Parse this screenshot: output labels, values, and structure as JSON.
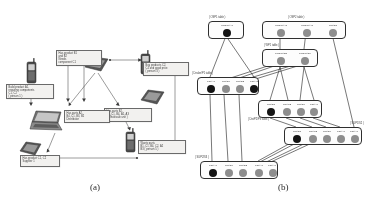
{
  "figure": {
    "caption_a": "(a)",
    "caption_b": "(b)"
  },
  "panel_a": {
    "name": "scenario-diagram",
    "devices": [
      {
        "id": "phone-1",
        "type": "mobile-phone",
        "x": 26,
        "y": 58,
        "w": 11,
        "h": 26
      },
      {
        "id": "pda-1",
        "type": "pda-tablet",
        "x": 83,
        "y": 55,
        "w": 26,
        "h": 18
      },
      {
        "id": "phone-2",
        "type": "mobile-phone",
        "x": 140,
        "y": 50,
        "w": 11,
        "h": 24
      },
      {
        "id": "pda-2",
        "type": "pda-tablet",
        "x": 139,
        "y": 88,
        "w": 26,
        "h": 18
      },
      {
        "id": "laptop-1",
        "type": "laptop",
        "x": 28,
        "y": 108,
        "w": 38,
        "h": 24
      },
      {
        "id": "pda-3",
        "type": "pda-tablet",
        "x": 18,
        "y": 140,
        "w": 24,
        "h": 17
      },
      {
        "id": "phone-3",
        "type": "mobile-phone",
        "x": 125,
        "y": 128,
        "w": 11,
        "h": 24
      }
    ],
    "callouts": [
      {
        "id": "callout-left",
        "x": 6,
        "y": 84,
        "w": 48,
        "h": 15,
        "text": "Build product A1,\nrequiring components\nC1, C2\n( person 1 )"
      },
      {
        "id": "callout-top",
        "x": 56,
        "y": 50,
        "w": 46,
        "h": 16,
        "text": "Has product B1\nand B2\nNeeds\ncomponent C1"
      },
      {
        "id": "callout-right-top",
        "x": 143,
        "y": 62,
        "w": 46,
        "h": 14,
        "text": "Buy products C2,\nC4 and good price\n( person 3 )"
      },
      {
        "id": "callout-mid-right",
        "x": 104,
        "y": 108,
        "w": 48,
        "h": 14,
        "text": "Has parts B2,\nB3, C1, B4, A1, A3\n( Wholesale unit )"
      },
      {
        "id": "callout-laptop",
        "x": 64,
        "y": 110,
        "w": 46,
        "h": 13,
        "text": "Has parts A2,\nB4, C1, B3, B2\nDistributor"
      },
      {
        "id": "callout-bottom",
        "x": 138,
        "y": 140,
        "w": 48,
        "h": 14,
        "text": "Wants parts\nB1, C1, B4, C2, A2\nB3 ( person 5 )"
      },
      {
        "id": "callout-bottom-left",
        "x": 20,
        "y": 155,
        "w": 40,
        "h": 12,
        "text": "Has product C1, C2\nSupplier 1"
      }
    ]
  },
  "panel_b": {
    "name": "layered-node-graph",
    "clusters": [
      {
        "id": "cluster-top-left",
        "title": "( OSP1 table )",
        "title_x": 17,
        "title_y": 16,
        "x": 16,
        "y": 21,
        "w": 36,
        "h": 18,
        "nodes": [
          {
            "id": "b1-n1",
            "shade": "black",
            "cx": 18,
            "cy": 11,
            "r": 4.2,
            "label": "Product A1"
          }
        ]
      },
      {
        "id": "cluster-top-right",
        "title": "( OSP2 table )",
        "title_x": 96,
        "title_y": 16,
        "x": 70,
        "y": 21,
        "w": 84,
        "h": 18,
        "nodes": [
          {
            "id": "b2-n1",
            "shade": "gray",
            "cx": 18,
            "cy": 11,
            "r": 4.2,
            "label": "Product A2"
          },
          {
            "id": "b2-n2",
            "shade": "gray",
            "cx": 44,
            "cy": 11,
            "r": 4.2,
            "label": "Product A3"
          },
          {
            "id": "b2-n3",
            "shade": "gray",
            "cx": 70,
            "cy": 11,
            "r": 4.2,
            "label": "Part B1"
          }
        ]
      },
      {
        "id": "cluster-mid-right",
        "title": "( WP1 table )",
        "title_x": 72,
        "title_y": 44,
        "x": 70,
        "y": 49,
        "w": 56,
        "h": 18,
        "nodes": [
          {
            "id": "b3-n1",
            "shade": "gray",
            "cx": 18,
            "cy": 11,
            "r": 4.2,
            "label": "Product B2"
          },
          {
            "id": "b3-n2",
            "shade": "gray",
            "cx": 42,
            "cy": 11,
            "r": 4.2,
            "label": "Product B4"
          }
        ]
      },
      {
        "id": "cluster-mid-left",
        "title": "( Dealer/P1 table )",
        "title_x": 0,
        "title_y": 72,
        "x": 5,
        "y": 77,
        "w": 62,
        "h": 18,
        "nodes": [
          {
            "id": "b4-n1",
            "shade": "black",
            "cx": 13,
            "cy": 11,
            "r": 4.4,
            "label": "Part A1"
          },
          {
            "id": "b4-n2",
            "shade": "gray",
            "cx": 28,
            "cy": 11,
            "r": 4.0,
            "label": "Part B4"
          },
          {
            "id": "b4-n3",
            "shade": "gray",
            "cx": 42,
            "cy": 11,
            "r": 4.0,
            "label": "Part B2"
          },
          {
            "id": "b4-n4",
            "shade": "black",
            "cx": 56,
            "cy": 11,
            "r": 4.4,
            "label": "Part A2"
          }
        ]
      },
      {
        "id": "cluster-center-low",
        "title": "( DistP2/P3 table )",
        "title_x": 56,
        "title_y": 118,
        "x": 66,
        "y": 100,
        "w": 64,
        "h": 18,
        "nodes": [
          {
            "id": "b5-n1",
            "shade": "black",
            "cx": 12,
            "cy": 11,
            "r": 4.4,
            "label": "Part B1"
          },
          {
            "id": "b5-n2",
            "shade": "gray",
            "cx": 28,
            "cy": 11,
            "r": 4.0,
            "label": "Part C2"
          },
          {
            "id": "b5-n3",
            "shade": "gray",
            "cx": 42,
            "cy": 11,
            "r": 4.0,
            "label": "Part B4"
          },
          {
            "id": "b5-n4",
            "shade": "gray",
            "cx": 55,
            "cy": 11,
            "r": 4.0,
            "label": "Part A7"
          }
        ]
      },
      {
        "id": "cluster-right-low",
        "title": "( SUP1/S2 )",
        "title_x": 158,
        "title_y": 122,
        "x": 92,
        "y": 127,
        "w": 78,
        "h": 18,
        "nodes": [
          {
            "id": "b6-n1",
            "shade": "black",
            "cx": 12,
            "cy": 11,
            "r": 4.4,
            "label": "Part B1"
          },
          {
            "id": "b6-n2",
            "shade": "gray",
            "cx": 28,
            "cy": 11,
            "r": 4.0,
            "label": "Part C2"
          },
          {
            "id": "b6-n3",
            "shade": "gray",
            "cx": 42,
            "cy": 11,
            "r": 4.0,
            "label": "Part B4"
          },
          {
            "id": "b6-n4",
            "shade": "gray",
            "cx": 56,
            "cy": 11,
            "r": 4.0,
            "label": "Part A7"
          },
          {
            "id": "b6-n5",
            "shade": "gray",
            "cx": 70,
            "cy": 11,
            "r": 4.0,
            "label": "Part A1"
          }
        ]
      },
      {
        "id": "cluster-bottom-left",
        "title": "( SUP2/S3 )",
        "title_x": 3,
        "title_y": 156,
        "x": 8,
        "y": 161,
        "w": 78,
        "h": 18,
        "nodes": [
          {
            "id": "b7-n1",
            "shade": "black",
            "cx": 12,
            "cy": 11,
            "r": 4.4,
            "label": "Part A1"
          },
          {
            "id": "b7-n2",
            "shade": "gray",
            "cx": 28,
            "cy": 11,
            "r": 4.0,
            "label": "Part B4"
          },
          {
            "id": "b7-n3",
            "shade": "gray",
            "cx": 42,
            "cy": 11,
            "r": 4.0,
            "label": "Part B2"
          },
          {
            "id": "b7-n4",
            "shade": "gray",
            "cx": 58,
            "cy": 11,
            "r": 4.0,
            "label": "Part A1"
          },
          {
            "id": "b7-n5",
            "shade": "gray",
            "cx": 72,
            "cy": 11,
            "r": 4.0,
            "label": "Part A7"
          }
        ]
      }
    ],
    "legend": {
      "black_node": "matched / requested item",
      "gray_node": "available item"
    }
  }
}
